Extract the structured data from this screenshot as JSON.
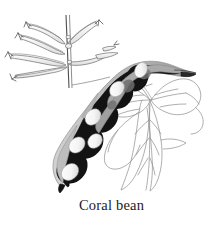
{
  "figure": {
    "caption": "Coral bean",
    "background_color": "#ffffff",
    "caption_color": "#1c1c1c",
    "parts": [
      {
        "name": "flower-cluster",
        "label": "tubular coral bean flowers on upright stem",
        "style": "outline",
        "stroke_color": "#6e6e6e",
        "fill_color": "#f3f3f3"
      },
      {
        "name": "seed-pod",
        "label": "constricted seed pod with visible seeds",
        "style": "filled",
        "stroke_color": "#1a1a1a",
        "fill_color": "#111111",
        "highlight_color": "#b0b0b0",
        "seed_color": "#f2f2f2",
        "seed_count": 6
      },
      {
        "name": "leaves",
        "label": "trifoliate arrowhead-shaped leaflets",
        "style": "outline",
        "stroke_color": "#8a8a8a",
        "fill_color": "none"
      },
      {
        "name": "stem",
        "label": "vertical flower stalk",
        "style": "outline",
        "stroke_color": "#5a5a5a"
      }
    ]
  }
}
